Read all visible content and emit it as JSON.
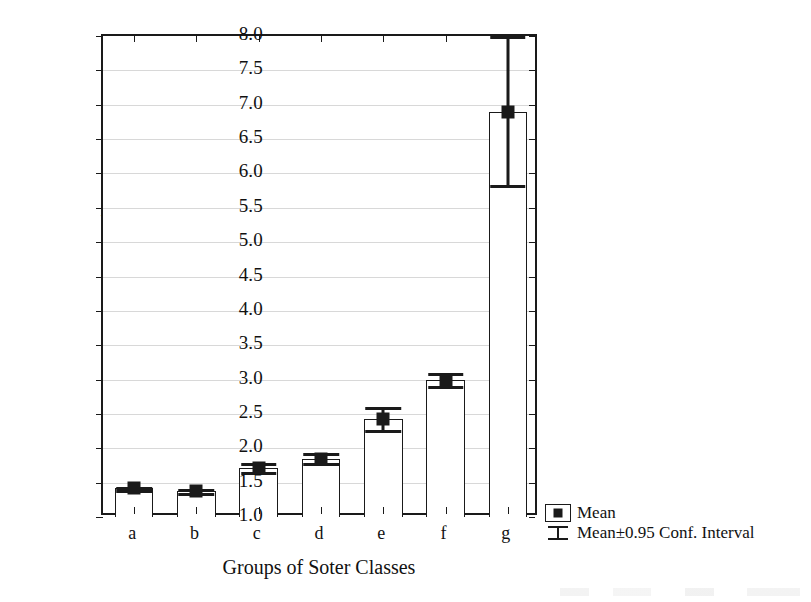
{
  "chart_data": {
    "type": "bar",
    "title": "",
    "xlabel": "Groups of Soter Classes",
    "ylabel": "SOC Content (dag kg-1)",
    "ylabel_main": "SOC Content (dag kg",
    "ylabel_exp": "-1",
    "ylabel_tail": ")",
    "categories": [
      "a",
      "b",
      "c",
      "d",
      "e",
      "f",
      "g"
    ],
    "values": [
      1.42,
      1.38,
      1.72,
      1.85,
      2.42,
      3.0,
      6.9
    ],
    "ci_lower": [
      1.4,
      1.35,
      1.66,
      1.78,
      2.26,
      2.9,
      5.83
    ],
    "ci_upper": [
      1.44,
      1.41,
      1.78,
      1.93,
      2.6,
      3.09,
      8.0
    ],
    "ylim": [
      1.0,
      8.0
    ],
    "ytick_step": 0.5,
    "yticks": [
      "8.0",
      "7.5",
      "7.0",
      "6.5",
      "6.0",
      "5.5",
      "5.0",
      "4.5",
      "4.0",
      "3.5",
      "3.0",
      "2.5",
      "2.0",
      "1.5",
      "1.0"
    ],
    "ytick_values": [
      8.0,
      7.5,
      7.0,
      6.5,
      6.0,
      5.5,
      5.0,
      4.5,
      4.0,
      3.5,
      3.0,
      2.5,
      2.0,
      1.5,
      1.0
    ],
    "grid": true,
    "grid_axis": "y",
    "legend_position": "bottom-right",
    "bar_color": "#ffffff",
    "bar_edge_color": "#1a1a1a",
    "marker_color": "#1a1a1a",
    "grid_color": "#d8d8d8"
  },
  "legend": {
    "entries": [
      {
        "key": "mean-marker-key",
        "label": "Mean"
      },
      {
        "key": "conf-interval-key",
        "label": "Mean±0.95 Conf. Interval"
      }
    ]
  }
}
